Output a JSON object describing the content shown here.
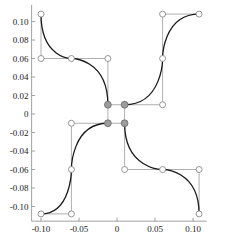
{
  "chart_data": {
    "type": "line",
    "title": "",
    "xlabel": "",
    "ylabel": "",
    "xlim": [
      -0.115,
      0.118
    ],
    "ylim": [
      -0.118,
      0.118
    ],
    "grid": false,
    "legend": null,
    "xticks": [
      -0.1,
      -0.05,
      0,
      0.05,
      0.1
    ],
    "xtick_labels": [
      "-0.10",
      "-0.05",
      "0",
      "0.05",
      "0.10"
    ],
    "yticks": [
      0.1,
      0.08,
      0.06,
      0.04,
      0.02,
      0,
      -0.02,
      -0.04,
      -0.06,
      -0.08,
      -0.1
    ],
    "ytick_labels": [
      "0.10",
      "0.08",
      "0.06",
      "0.04",
      "0.02",
      "0",
      "-0.02",
      "-0.04",
      "-0.06",
      "-0.08",
      "-0.10"
    ],
    "series": [
      {
        "name": "spline-segment-top-left",
        "type": "bezier",
        "points": [
          {
            "x": -0.1,
            "y": 0.108
          },
          {
            "x": -0.1,
            "y": 0.06
          },
          {
            "x": -0.06,
            "y": 0.06
          },
          {
            "x": -0.012,
            "y": 0.06
          },
          {
            "x": -0.012,
            "y": 0.01
          }
        ]
      },
      {
        "name": "spline-segment-top-right",
        "type": "bezier",
        "points": [
          {
            "x": 0.01,
            "y": 0.01
          },
          {
            "x": 0.06,
            "y": 0.01
          },
          {
            "x": 0.06,
            "y": 0.06
          },
          {
            "x": 0.06,
            "y": 0.108
          },
          {
            "x": 0.108,
            "y": 0.108
          }
        ]
      },
      {
        "name": "spline-segment-bottom-left",
        "type": "bezier",
        "points": [
          {
            "x": -0.1,
            "y": -0.108
          },
          {
            "x": -0.06,
            "y": -0.108
          },
          {
            "x": -0.06,
            "y": -0.06
          },
          {
            "x": -0.06,
            "y": -0.01
          },
          {
            "x": -0.012,
            "y": -0.01
          }
        ]
      },
      {
        "name": "spline-segment-bottom-right",
        "type": "bezier",
        "points": [
          {
            "x": 0.01,
            "y": -0.01
          },
          {
            "x": 0.01,
            "y": -0.06
          },
          {
            "x": 0.06,
            "y": -0.06
          },
          {
            "x": 0.108,
            "y": -0.06
          },
          {
            "x": 0.108,
            "y": -0.108
          }
        ]
      }
    ],
    "control_polygons": [
      {
        "name": "polygon-top-left",
        "vertices": [
          {
            "x": -0.1,
            "y": 0.108
          },
          {
            "x": -0.1,
            "y": 0.06
          },
          {
            "x": -0.06,
            "y": 0.06
          },
          {
            "x": -0.012,
            "y": 0.06
          },
          {
            "x": -0.012,
            "y": 0.01
          }
        ]
      },
      {
        "name": "polygon-top-right",
        "vertices": [
          {
            "x": 0.01,
            "y": 0.01
          },
          {
            "x": 0.06,
            "y": 0.01
          },
          {
            "x": 0.06,
            "y": 0.06
          },
          {
            "x": 0.06,
            "y": 0.108
          },
          {
            "x": 0.108,
            "y": 0.108
          }
        ]
      },
      {
        "name": "polygon-bottom-left",
        "vertices": [
          {
            "x": -0.1,
            "y": -0.108
          },
          {
            "x": -0.06,
            "y": -0.108
          },
          {
            "x": -0.06,
            "y": -0.06
          },
          {
            "x": -0.06,
            "y": -0.01
          },
          {
            "x": -0.012,
            "y": -0.01
          }
        ]
      },
      {
        "name": "polygon-bottom-right",
        "vertices": [
          {
            "x": 0.01,
            "y": -0.01
          },
          {
            "x": 0.01,
            "y": -0.06
          },
          {
            "x": 0.06,
            "y": -0.06
          },
          {
            "x": 0.108,
            "y": -0.06
          },
          {
            "x": 0.108,
            "y": -0.108
          }
        ]
      },
      {
        "name": "polygon-center-square",
        "vertices": [
          {
            "x": -0.012,
            "y": 0.01
          },
          {
            "x": 0.01,
            "y": 0.01
          },
          {
            "x": 0.01,
            "y": -0.01
          },
          {
            "x": -0.012,
            "y": -0.01
          },
          {
            "x": -0.012,
            "y": 0.01
          }
        ]
      }
    ],
    "open_markers": [
      {
        "x": -0.1,
        "y": 0.108
      },
      {
        "x": -0.1,
        "y": 0.06
      },
      {
        "x": -0.06,
        "y": 0.06
      },
      {
        "x": -0.012,
        "y": 0.06
      },
      {
        "x": 0.06,
        "y": 0.01
      },
      {
        "x": 0.06,
        "y": 0.06
      },
      {
        "x": 0.06,
        "y": 0.108
      },
      {
        "x": 0.108,
        "y": 0.108
      },
      {
        "x": -0.06,
        "y": -0.01
      },
      {
        "x": -0.06,
        "y": -0.06
      },
      {
        "x": -0.06,
        "y": -0.108
      },
      {
        "x": -0.1,
        "y": -0.108
      },
      {
        "x": 0.01,
        "y": -0.06
      },
      {
        "x": 0.06,
        "y": -0.06
      },
      {
        "x": 0.108,
        "y": -0.06
      },
      {
        "x": 0.108,
        "y": -0.108
      }
    ],
    "filled_markers": [
      {
        "x": -0.012,
        "y": 0.01
      },
      {
        "x": 0.01,
        "y": 0.01
      },
      {
        "x": -0.012,
        "y": -0.01
      },
      {
        "x": 0.01,
        "y": -0.01
      }
    ],
    "colors": {
      "curve": "#1a1a1a",
      "polygon": "#9a9a9a",
      "axis": "#8a8a8a",
      "open_marker_fill": "#ffffff",
      "open_marker_stroke": "#8a8a8a",
      "filled_marker_fill": "#9c9c9c",
      "filled_marker_stroke": "#6f6f6f",
      "background": "#ffffff"
    }
  }
}
